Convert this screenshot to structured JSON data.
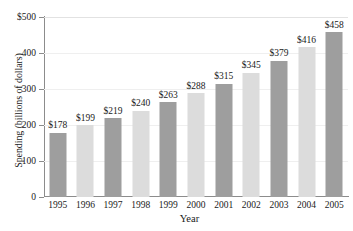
{
  "chart_data": {
    "type": "bar",
    "title": "",
    "xlabel": "Year",
    "ylabel": "Spending (billions of dollars)",
    "categories": [
      "1995",
      "1996",
      "1997",
      "1998",
      "1999",
      "2000",
      "2001",
      "2002",
      "2003",
      "2004",
      "2005"
    ],
    "values": [
      178,
      199,
      219,
      240,
      263,
      288,
      315,
      345,
      379,
      416,
      458
    ],
    "value_labels": [
      "$178",
      "$199",
      "$219",
      "$240",
      "$263",
      "$288",
      "$315",
      "$345",
      "$379",
      "$416",
      "$458"
    ],
    "bar_colors": [
      "#9e9e9e",
      "#dcdcdc",
      "#9e9e9e",
      "#dcdcdc",
      "#9e9e9e",
      "#dcdcdc",
      "#9e9e9e",
      "#dcdcdc",
      "#9e9e9e",
      "#dcdcdc",
      "#9e9e9e"
    ],
    "ylim": [
      0,
      500
    ],
    "ytick_values": [
      500,
      400,
      300,
      200,
      100,
      0
    ],
    "ytick_labels": [
      "$500",
      "400",
      "300",
      "200",
      "100",
      "0"
    ],
    "grid": true,
    "legend": "none",
    "colors": {
      "bar_dark": "#9e9e9e",
      "bar_light": "#dcdcdc",
      "axis": "#8c8c8c",
      "gridline": "#efefef",
      "text": "#1a1a1a",
      "background": "#ffffff"
    }
  }
}
